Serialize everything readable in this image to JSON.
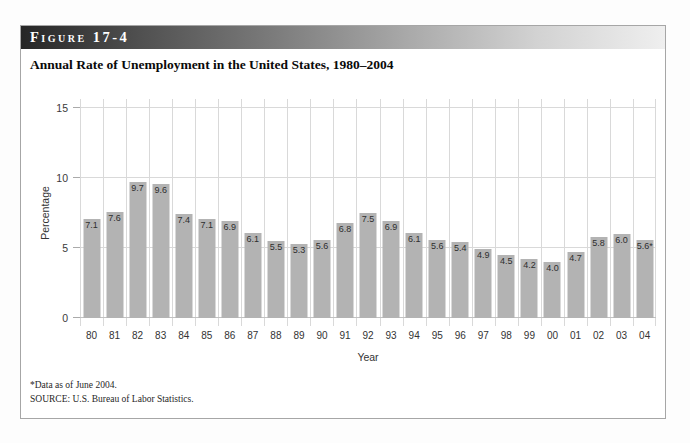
{
  "figure": {
    "label": "Figure 17-4",
    "title": "Annual Rate of Unemployment in the United States, 1980–2004"
  },
  "chart_data": {
    "type": "bar",
    "title": "Annual Rate of Unemployment in the United States, 1980–2004",
    "xlabel": "Year",
    "ylabel": "Percentage",
    "ylim": [
      0,
      15
    ],
    "yticks": [
      0,
      5,
      10,
      15
    ],
    "grid": true,
    "legend": "none",
    "categories": [
      "80",
      "81",
      "82",
      "83",
      "84",
      "85",
      "86",
      "87",
      "88",
      "89",
      "90",
      "91",
      "92",
      "93",
      "94",
      "95",
      "96",
      "97",
      "98",
      "99",
      "00",
      "01",
      "02",
      "03",
      "04"
    ],
    "values": [
      7.1,
      7.6,
      9.7,
      9.6,
      7.4,
      7.1,
      6.9,
      6.1,
      5.5,
      5.3,
      5.6,
      6.8,
      7.5,
      6.9,
      6.1,
      5.6,
      5.4,
      4.9,
      4.5,
      4.2,
      4.0,
      4.7,
      5.8,
      6.0,
      5.6
    ],
    "bar_labels": [
      "7.1",
      "7.6",
      "9.7",
      "9.6",
      "7.4",
      "7.1",
      "6.9",
      "6.1",
      "5.5",
      "5.3",
      "5.6",
      "6.8",
      "7.5",
      "6.9",
      "6.1",
      "5.6",
      "5.4",
      "4.9",
      "4.5",
      "4.2",
      "4.0",
      "4.7",
      "5.8",
      "6.0",
      "5.6*"
    ],
    "bar_color": "#b3b3b3",
    "grid_color": "#d9d9d9"
  },
  "footnotes": {
    "note": "*Data as of June 2004.",
    "source": "SOURCE: U.S. Bureau of Labor Statistics."
  },
  "colors": {
    "header_gradient_start": "#262626",
    "header_gradient_end": "#efefef",
    "header_text": "#ffffff",
    "panel_border": "#a6a6a6",
    "background": "#ffffff"
  }
}
